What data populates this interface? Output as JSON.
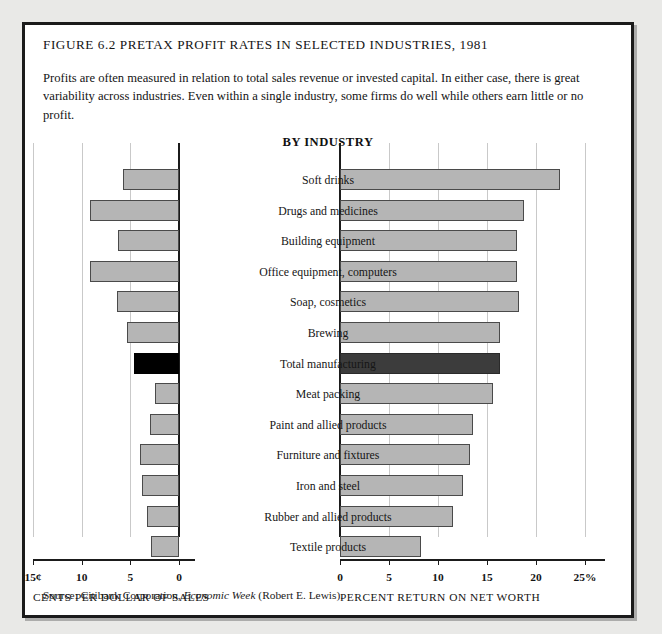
{
  "figure": {
    "title": "FIGURE 6.2   PRETAX PROFIT RATES IN SELECTED INDUSTRIES, 1981",
    "intro": "Profits are often measured in relation to total sales revenue or invested capital. In either case, there is great variability across industries. Even within a single industry, some firms do well while others earn little or no profit.",
    "panel_heading": "BY INDUSTRY",
    "source_prefix": "Source: Citibank Corporation, ",
    "source_italic": "Economic Week",
    "source_suffix": " (Robert E. Lewis)."
  },
  "colors": {
    "bar_fill": "#b5b5b5",
    "bar_stroke": "#4a4a4a",
    "highlight_left": "#000000",
    "highlight_right": "#3c3c3c",
    "axis": "#1b1b1b",
    "grid": "#c9c9c9",
    "page_background": "#e9e9e7",
    "frame_background": "#ffffff"
  },
  "chart_data": {
    "type": "bar",
    "title": "FIGURE 6.2   PRETAX PROFIT RATES IN SELECTED INDUSTRIES, 1981",
    "subtitle": "BY INDUSTRY",
    "orientation": "horizontal",
    "grid": true,
    "legend": "none",
    "highlight_category": "Total manufacturing",
    "categories": [
      "Soft drinks",
      "Drugs and medicines",
      "Building equipment",
      "Office equipment, computers",
      "Soap, cosmetics",
      "Brewing",
      "Total manufacturing",
      "Meat packing",
      "Paint and allied products",
      "Furniture and fixtures",
      "Iron and steel",
      "Rubber and allied products",
      "Textile products"
    ],
    "series": [
      {
        "name": "Cents per dollar of sales",
        "panel": "left",
        "direction": "reversed",
        "units": "cents",
        "xlabel": "CENTS PER DOLLAR OF SALES",
        "xlim": [
          0,
          15
        ],
        "ticks": [
          15,
          10,
          5,
          0
        ],
        "tick_labels": [
          "15¢",
          "10",
          "5",
          "0"
        ],
        "values": [
          5.8,
          9.1,
          6.3,
          9.1,
          6.4,
          5.3,
          4.6,
          2.5,
          3.0,
          4.0,
          3.8,
          3.3,
          2.9
        ]
      },
      {
        "name": "Percent return on net worth",
        "panel": "right",
        "direction": "normal",
        "units": "percent",
        "xlabel": "PERCENT RETURN ON NET WORTH",
        "xlim": [
          0,
          25
        ],
        "ticks": [
          0,
          5,
          10,
          15,
          20,
          25
        ],
        "tick_labels": [
          "0",
          "5",
          "10",
          "15",
          "20",
          "25%"
        ],
        "values": [
          22.4,
          18.8,
          18.1,
          18.1,
          18.3,
          16.3,
          16.3,
          15.6,
          13.6,
          13.3,
          12.6,
          11.5,
          8.3
        ]
      }
    ]
  }
}
